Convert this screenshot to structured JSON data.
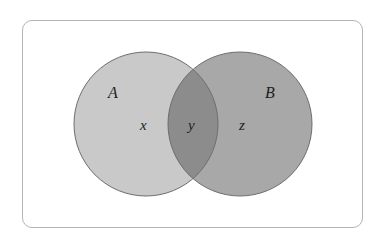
{
  "diagram": {
    "type": "venn",
    "sets": [
      {
        "name": "A",
        "fill": "#c9c9c9"
      },
      {
        "name": "B",
        "fill": "#a8a8a8"
      }
    ],
    "intersection_fill": "#8c8c8c",
    "stroke": "#6e6e6e",
    "regions": {
      "a_only": "x",
      "a_and_b": "y",
      "b_only": "z"
    },
    "labels": {
      "set_a": "A",
      "set_b": "B"
    }
  }
}
